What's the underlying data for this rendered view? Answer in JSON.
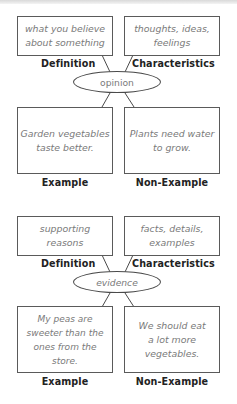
{
  "diagrams": [
    {
      "concept": "opinion",
      "definition": {
        "label": "Definition",
        "lines": [
          "what you believe",
          "about something"
        ]
      },
      "characteristics": {
        "label": "Characteristics",
        "lines": [
          "thoughts, ideas,",
          "feelings"
        ]
      },
      "example": {
        "label": "Example",
        "lines": [
          "Garden vegetables",
          "taste better."
        ]
      },
      "non_example": {
        "label": "Non-Example",
        "lines": [
          "Plants need water",
          "to grow."
        ]
      }
    },
    {
      "concept": "evidence",
      "definition": {
        "label": "Definition",
        "lines": [
          "supporting",
          "reasons"
        ]
      },
      "characteristics": {
        "label": "Characteristics",
        "lines": [
          "facts, details,",
          "examples"
        ]
      },
      "example": {
        "label": "Example",
        "lines": [
          "My peas are",
          "sweeter than the",
          "ones from the store."
        ]
      },
      "non_example": {
        "label": "Non-Example",
        "lines": [
          "We should eat",
          "a lot more",
          "vegetables."
        ]
      }
    }
  ],
  "colors": {
    "border": "#5a5a5a",
    "box_text": "#7a7a7a",
    "label_text": "#222222"
  }
}
